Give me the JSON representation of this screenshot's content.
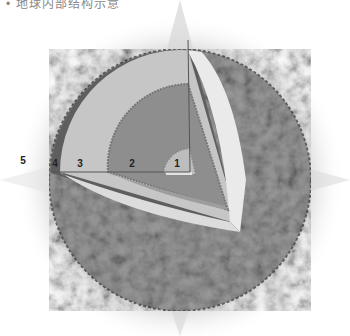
{
  "caption": "• 地球内部结构示意",
  "diagram": {
    "colors": {
      "surface": "#7a7a7a",
      "surface_light": "#a8a8a8",
      "crust_band": "#5e5e5e",
      "mantle": "#c4c4c4",
      "cut_face": "#e6e6e6",
      "outer_core": "#8e8e8e",
      "inner_core": "#b8b8b8",
      "line": "#555555",
      "glow": "#bdbdbd"
    },
    "labels": [
      {
        "id": "5",
        "text": "5",
        "x": 23,
        "y": 160
      },
      {
        "id": "4",
        "text": "4",
        "x": 55,
        "y": 163
      },
      {
        "id": "3",
        "text": "3",
        "x": 80,
        "y": 163
      },
      {
        "id": "2",
        "text": "2",
        "x": 132,
        "y": 163
      },
      {
        "id": "1",
        "text": "1",
        "x": 177,
        "y": 163
      }
    ]
  }
}
